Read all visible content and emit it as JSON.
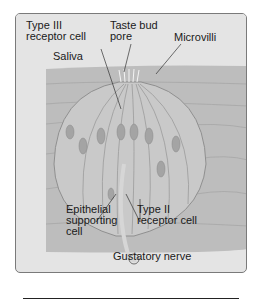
{
  "diagram": {
    "title": "Taste bud",
    "labels": {
      "type3": "Type III\nreceptor cell",
      "pore": "Taste bud\npore",
      "microvilli": "Microvilli",
      "saliva": "Saliva",
      "epithelial": "Epithelial\nsupporting\ncell",
      "type2": "Type II\nreceptor cell",
      "nerve": "Gustatory nerve"
    },
    "colors": {
      "panel": "#e4e4e4",
      "tissue": "#b9b9b9",
      "bud": "#c8c8c8",
      "nucleus": "#9e9e9e"
    }
  }
}
